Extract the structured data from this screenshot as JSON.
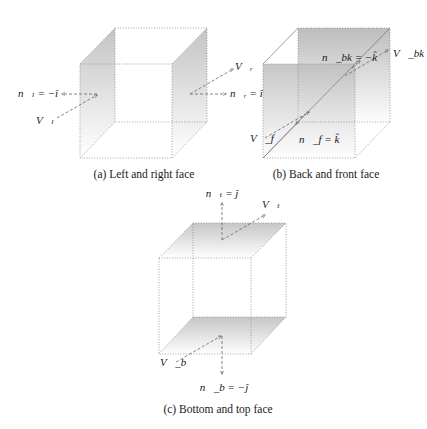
{
  "figures": [
    {
      "id": "a",
      "caption": "(a) Left and right face",
      "labels": {
        "n_left": "n⃗ₗ = −î",
        "v_left": "V⃗ₗ",
        "v_right": "V⃗ᵣ",
        "n_right": "n⃗ᵣ = î"
      }
    },
    {
      "id": "b",
      "caption": "(b) Back and front face",
      "labels": {
        "n_back": "n⃗_bk = −k̂",
        "v_back": "V⃗_bk",
        "v_front": "V⃗_f",
        "n_front": "n⃗_f = k̂"
      }
    },
    {
      "id": "c",
      "caption": "(c) Bottom and top face",
      "labels": {
        "n_top": "n⃗ₜ = ĵ",
        "v_top": "V⃗ₜ",
        "v_bottom": "V⃗_b",
        "n_bottom": "n⃗_b = −ĵ"
      }
    }
  ],
  "colors": {
    "shade_dark": "#c8c8c8",
    "shade_light": "#ffffff",
    "edge": "#8a8a8a",
    "text": "#1a1a1a"
  }
}
